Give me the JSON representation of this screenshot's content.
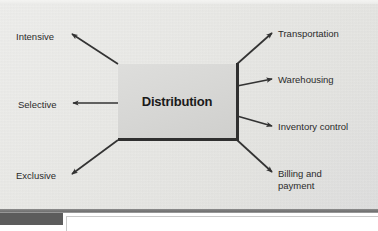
{
  "diagram": {
    "title": "Distribution",
    "center_node": {
      "label": "Distribution",
      "fill_color": "#d8d8d6",
      "shadow_color": "#2f2f2f"
    },
    "background_color": "#e8e8e6",
    "arrow_color": "#333333",
    "left_branches": [
      {
        "label": "Intensive",
        "direction": "up-left"
      },
      {
        "label": "Selective",
        "direction": "left"
      },
      {
        "label": "Exclusive",
        "direction": "down-left"
      }
    ],
    "right_branches": [
      {
        "label": "Transportation",
        "direction": "up-right"
      },
      {
        "label": "Warehousing",
        "direction": "right"
      },
      {
        "label": "Inventory control",
        "direction": "right"
      },
      {
        "label": "Billing and\npayment",
        "direction": "down-right"
      }
    ],
    "branch_labels": {
      "intensive": "Intensive",
      "selective": "Selective",
      "exclusive": "Exclusive",
      "transportation": "Transportation",
      "warehousing": "Warehousing",
      "inventory_control": "Inventory control",
      "billing_line1": "Billing and",
      "billing_line2": "payment"
    }
  },
  "footer": {
    "tab_color": "#5c5c5c",
    "rule_color": "#6f6f6f",
    "panel_color": "#ffffff"
  }
}
